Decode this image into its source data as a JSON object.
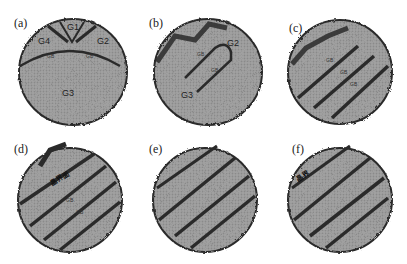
{
  "figure": {
    "panels": [
      {
        "id": "a",
        "label": "(a)",
        "grains": [
          "G1",
          "G2",
          "G3",
          "G4"
        ],
        "small_labels": [
          "GB",
          "GB"
        ]
      },
      {
        "id": "b",
        "label": "(b)",
        "grains": [
          "G2",
          "G3"
        ],
        "small_labels": [
          "GB",
          "GB"
        ]
      },
      {
        "id": "c",
        "label": "(c)",
        "small_labels": [
          "GB",
          "GB",
          "GB"
        ]
      },
      {
        "id": "d",
        "label": "(d)",
        "grains": [
          "G1"
        ],
        "annotation": "晶界面",
        "small_labels": [
          "GB",
          "GB"
        ]
      },
      {
        "id": "e",
        "label": "(e)"
      },
      {
        "id": "f",
        "label": "(f)",
        "annotation": "晶界"
      }
    ],
    "colors": {
      "grain_fill": "#9a9a9a",
      "boundary": "#2a2a2a",
      "background": "#ffffff"
    }
  }
}
